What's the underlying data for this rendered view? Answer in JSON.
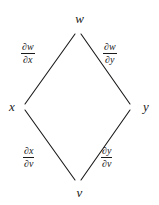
{
  "figure": {
    "type": "chain-rule-dependency-diagram",
    "shape": "diamond",
    "background_color": "#ffffff",
    "line_color": "#1a1a1a",
    "text_color": "#1a1a1a"
  },
  "nodes": {
    "top": {
      "id": "w",
      "label": "w",
      "x": 78,
      "y": 31
    },
    "left": {
      "id": "x",
      "label": "x",
      "x": 22,
      "y": 107
    },
    "right": {
      "id": "y",
      "label": "y",
      "x": 133,
      "y": 107
    },
    "bottom": {
      "id": "v",
      "label": "v",
      "x": 78,
      "y": 182
    }
  },
  "edges": [
    {
      "name": "w-to-x",
      "from": "w",
      "to": "x",
      "label": {
        "numerator": "∂w",
        "denominator": "∂x",
        "text": "∂w/∂x"
      }
    },
    {
      "name": "w-to-y",
      "from": "w",
      "to": "y",
      "label": {
        "numerator": "∂w",
        "denominator": "∂y",
        "text": "∂w/∂y"
      }
    },
    {
      "name": "x-to-v",
      "from": "x",
      "to": "v",
      "label": {
        "numerator": "∂x",
        "denominator": "∂v",
        "text": "∂x/∂v"
      }
    },
    {
      "name": "y-to-v",
      "from": "y",
      "to": "v",
      "label": {
        "numerator": "∂y",
        "denominator": "∂v",
        "text": "∂y/∂v"
      }
    }
  ]
}
